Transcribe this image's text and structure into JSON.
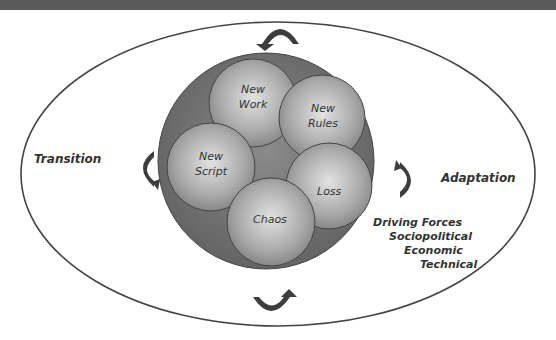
{
  "header": {
    "color": "#5a5a5a"
  },
  "diagram": {
    "outer_labels": {
      "left": "Transition",
      "right": "Adaptation"
    },
    "circles": [
      {
        "id": "new-work",
        "lines": [
          "New",
          "Work"
        ]
      },
      {
        "id": "new-rules",
        "lines": [
          "New",
          "Rules"
        ]
      },
      {
        "id": "new-script",
        "lines": [
          "New",
          "Script"
        ]
      },
      {
        "id": "loss",
        "lines": [
          "Loss"
        ]
      },
      {
        "id": "chaos",
        "lines": [
          "Chaos"
        ]
      }
    ],
    "driving_forces": {
      "title": "Driving Forces",
      "items": [
        "Sociopolitical",
        "Economic",
        "Technical"
      ]
    },
    "arrows": [
      "top",
      "left",
      "right",
      "bottom"
    ],
    "colors": {
      "sphere_outer": "#6f6f6f",
      "sphere_inner": "#9a9a9a",
      "arrow": "#3d3d3d",
      "ellipse": "#444444"
    }
  }
}
